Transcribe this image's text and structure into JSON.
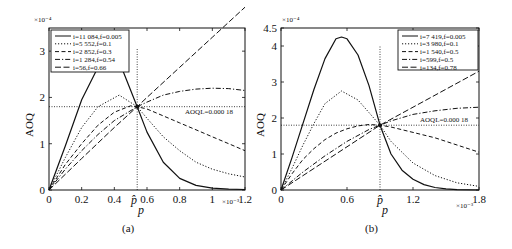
{
  "chart_data": [
    {
      "type": "line",
      "panel_label": "(a)",
      "xlabel": "p",
      "ylabel": "AOQ",
      "x_multiplier": "×10⁻³",
      "y_multiplier": "×10⁻⁴",
      "xlim": [
        0,
        1.2
      ],
      "ylim": [
        0,
        3.5
      ],
      "xticks": [
        "0",
        "0.2",
        "0.4",
        "0.6",
        "0.8",
        "1",
        "1.2"
      ],
      "yticks": [
        "0",
        "1",
        "2",
        "3"
      ],
      "p_hat_label": "p̂",
      "p_hat": 0.54,
      "aoql_label": "AOQL=0.000 18",
      "aoql": 1.8,
      "grid": false,
      "legend_position": "upper left",
      "series": [
        {
          "name": "i=11 084,f=0.005",
          "style": "solid",
          "x": [
            0,
            0.1,
            0.2,
            0.3,
            0.38,
            0.45,
            0.54,
            0.6,
            0.7,
            0.8,
            0.9,
            1.0,
            1.1,
            1.2
          ],
          "y": [
            0,
            0.95,
            1.95,
            2.65,
            2.85,
            2.6,
            1.8,
            1.25,
            0.6,
            0.25,
            0.1,
            0.04,
            0.02,
            0.01
          ]
        },
        {
          "name": "i=5 552,f=0.1",
          "style": "dotted",
          "x": [
            0,
            0.1,
            0.2,
            0.3,
            0.43,
            0.54,
            0.6,
            0.7,
            0.8,
            0.9,
            1.0,
            1.1,
            1.2
          ],
          "y": [
            0,
            0.7,
            1.35,
            1.8,
            2.05,
            1.8,
            1.55,
            1.15,
            0.85,
            0.6,
            0.45,
            0.35,
            0.28
          ]
        },
        {
          "name": "i=2 852,f=0.3",
          "style": "dashed",
          "x": [
            0,
            0.1,
            0.2,
            0.3,
            0.4,
            0.5,
            0.54,
            0.6,
            0.7,
            0.8,
            0.9,
            1.0,
            1.1,
            1.2
          ],
          "y": [
            0,
            0.55,
            1.0,
            1.4,
            1.68,
            1.82,
            1.8,
            1.75,
            1.6,
            1.45,
            1.3,
            1.15,
            1.0,
            0.85
          ]
        },
        {
          "name": "i=1 284,f=0.54",
          "style": "dashdot",
          "x": [
            0,
            0.1,
            0.2,
            0.3,
            0.4,
            0.54,
            0.6,
            0.7,
            0.8,
            0.9,
            1.0,
            1.1,
            1.2
          ],
          "y": [
            0,
            0.45,
            0.85,
            1.2,
            1.5,
            1.8,
            1.9,
            2.05,
            2.13,
            2.18,
            2.2,
            2.19,
            2.15
          ]
        },
        {
          "name": "i=56,f=0.66",
          "style": "longdash",
          "x": [
            0,
            0.2,
            0.4,
            0.54,
            0.6,
            0.8,
            1.0,
            1.2
          ],
          "y": [
            0,
            0.68,
            1.35,
            1.8,
            2.0,
            2.65,
            3.3,
            3.95
          ]
        }
      ]
    },
    {
      "type": "line",
      "panel_label": "(b)",
      "xlabel": "p",
      "ylabel": "AOQ",
      "x_multiplier": "×10⁻³",
      "y_multiplier": "×10⁻⁴",
      "xlim": [
        0,
        1.8
      ],
      "ylim": [
        0,
        4.5
      ],
      "xticks": [
        "0",
        "0.6",
        "1.2",
        "1.8"
      ],
      "yticks": [
        "0",
        "1",
        "2",
        "3",
        "4",
        "4.5"
      ],
      "p_hat_label": "p̂",
      "p_hat": 0.9,
      "aoql_label": "AOQL=0.000 18",
      "aoql": 1.8,
      "grid": false,
      "legend_position": "upper right",
      "series": [
        {
          "name": "i=7 419,f=0.005",
          "style": "solid",
          "x": [
            0,
            0.1,
            0.2,
            0.3,
            0.4,
            0.5,
            0.55,
            0.6,
            0.7,
            0.8,
            0.9,
            1.0,
            1.1,
            1.2,
            1.3,
            1.4,
            1.5,
            1.6,
            1.8
          ],
          "y": [
            0,
            0.9,
            1.85,
            2.8,
            3.65,
            4.2,
            4.25,
            4.2,
            3.75,
            2.9,
            1.8,
            1.0,
            0.55,
            0.3,
            0.15,
            0.07,
            0.03,
            0.01,
            0.0
          ]
        },
        {
          "name": "i=3 980,f=0.1",
          "style": "dotted",
          "x": [
            0,
            0.1,
            0.2,
            0.3,
            0.4,
            0.55,
            0.7,
            0.8,
            0.9,
            1.0,
            1.2,
            1.4,
            1.6,
            1.8
          ],
          "y": [
            0,
            0.6,
            1.25,
            1.85,
            2.4,
            2.75,
            2.5,
            2.15,
            1.8,
            1.35,
            0.75,
            0.4,
            0.2,
            0.1
          ]
        },
        {
          "name": "i=1 540,f=0.5",
          "style": "dashed",
          "x": [
            0,
            0.1,
            0.2,
            0.3,
            0.4,
            0.5,
            0.6,
            0.7,
            0.8,
            0.9,
            1.0,
            1.2,
            1.4,
            1.6,
            1.8
          ],
          "y": [
            0,
            0.45,
            0.85,
            1.15,
            1.4,
            1.58,
            1.7,
            1.78,
            1.82,
            1.8,
            1.75,
            1.6,
            1.45,
            1.25,
            1.05
          ]
        },
        {
          "name": "i=599,f=0.5",
          "style": "dashdot",
          "x": [
            0,
            0.2,
            0.4,
            0.6,
            0.8,
            0.9,
            1.0,
            1.2,
            1.4,
            1.6,
            1.8
          ],
          "y": [
            0,
            0.5,
            0.95,
            1.35,
            1.68,
            1.8,
            1.92,
            2.1,
            2.2,
            2.27,
            2.3
          ]
        },
        {
          "name": "i=134,f=0.78",
          "style": "longdash",
          "x": [
            0,
            0.3,
            0.6,
            0.9,
            1.2,
            1.5,
            1.8
          ],
          "y": [
            0,
            0.6,
            1.2,
            1.8,
            2.3,
            2.8,
            3.3
          ]
        }
      ]
    }
  ]
}
